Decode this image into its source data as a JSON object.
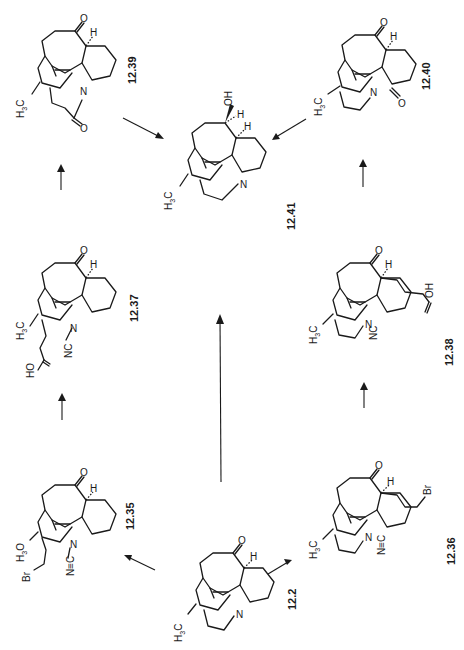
{
  "scheme": {
    "orientation": "rotated 90 degrees counter-clockwise (labels read bottom-to-top)",
    "compounds": [
      {
        "id": "12.39",
        "label": "12.39",
        "substituents": [
          "O",
          "H",
          "H3C",
          "N",
          "O"
        ]
      },
      {
        "id": "12.40",
        "label": "12.40",
        "substituents": [
          "O",
          "H",
          "H3C",
          "N",
          "O"
        ]
      },
      {
        "id": "12.41",
        "label": "12.41",
        "substituents": [
          "OH",
          "H",
          "H",
          "H3C",
          "N"
        ]
      },
      {
        "id": "12.37",
        "label": "12.37",
        "substituents": [
          "O",
          "H",
          "H3C",
          "N",
          "NC",
          "HO",
          "O"
        ]
      },
      {
        "id": "12.38",
        "label": "12.38",
        "substituents": [
          "O",
          "H",
          "H3C",
          "N",
          "NC",
          "OH",
          "O"
        ]
      },
      {
        "id": "12.35",
        "label": "12.35",
        "substituents": [
          "O",
          "H",
          "H3O",
          "Br",
          "N",
          "N≡C"
        ]
      },
      {
        "id": "12.36",
        "label": "12.36",
        "substituents": [
          "O",
          "H",
          "H3C",
          "Br",
          "N",
          "N≡C"
        ]
      },
      {
        "id": "12.2",
        "label": "12.2",
        "substituents": [
          "O",
          "H",
          "H3C",
          "N"
        ]
      }
    ],
    "arrows": [
      {
        "from": "12.2",
        "to": "12.35"
      },
      {
        "from": "12.2",
        "to": "12.36"
      },
      {
        "from": "12.2",
        "to": "12.41"
      },
      {
        "from": "12.35",
        "to": "12.37"
      },
      {
        "from": "12.36",
        "to": "12.38"
      },
      {
        "from": "12.37",
        "to": "12.39"
      },
      {
        "from": "12.38",
        "to": "12.40"
      },
      {
        "from": "12.39",
        "to": "12.41"
      },
      {
        "from": "12.40",
        "to": "12.41"
      }
    ]
  },
  "atoms": {
    "O": "O",
    "OH": "OH",
    "HO": "HO",
    "H": "H",
    "N": "N",
    "NC": "NC",
    "NtripleC": "N≡C",
    "Br": "Br",
    "H3C_H": "H",
    "H3C_3": "3",
    "H3C_C": "C",
    "H3O_O": "O"
  }
}
